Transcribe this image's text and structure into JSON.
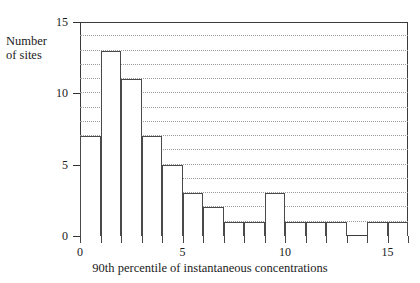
{
  "chart_data": {
    "type": "bar",
    "title": "",
    "subtitle": "",
    "xlabel": "90th percentile of instantaneous concentrations",
    "ylabel": "Number\nof sites",
    "ylabel_line1": "Number",
    "ylabel_line2": "of sites",
    "categories": [
      "0-1",
      "1-2",
      "2-3",
      "3-4",
      "4-5",
      "5-6",
      "6-7",
      "7-8",
      "8-9",
      "9-10",
      "10-11",
      "11-12",
      "12-13",
      "13-14",
      "14-15",
      "15-16"
    ],
    "bin_edges": [
      0,
      1,
      2,
      3,
      4,
      5,
      6,
      7,
      8,
      9,
      10,
      11,
      12,
      13,
      14,
      15,
      16
    ],
    "values": [
      7,
      13,
      11,
      7,
      5,
      3,
      2,
      1,
      1,
      3,
      1,
      1,
      1,
      0,
      1,
      1
    ],
    "xlim": [
      0,
      16
    ],
    "ylim": [
      0,
      15
    ],
    "xticks": [
      0,
      1,
      2,
      3,
      4,
      5,
      6,
      7,
      8,
      9,
      10,
      11,
      12,
      13,
      14,
      15,
      16
    ],
    "xtick_labels": [
      {
        "value": 0,
        "label": "0"
      },
      {
        "value": 5,
        "label": "5"
      },
      {
        "value": 10,
        "label": "10"
      },
      {
        "value": 15,
        "label": "15"
      }
    ],
    "yticks": [
      0,
      5,
      10,
      15
    ],
    "ytick_labels": [
      "0",
      "5",
      "10",
      "15"
    ],
    "gridlines_y": [
      1,
      2,
      3,
      4,
      5,
      6,
      7,
      8,
      9,
      10,
      11,
      12,
      13,
      14
    ],
    "grid": true,
    "grid_style": "dotted",
    "legend": null,
    "legend_position": "none",
    "colors": {
      "bar_fill": "#ffffff",
      "bar_edge": "#4a4a4a",
      "axis": "#3a3a3a",
      "grid": "#9a9a9a",
      "text": "#1b1b1b",
      "background": "#ffffff"
    }
  }
}
